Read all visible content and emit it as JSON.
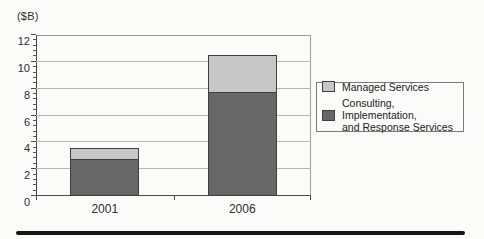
{
  "figure": {
    "legend": {
      "items": [
        {
          "label": "Managed Services",
          "color": "#c7c7c7"
        },
        {
          "label": "Consulting, Implementation,\nand Response Services",
          "color": "#676767"
        }
      ]
    }
  },
  "chart_data": {
    "type": "bar",
    "stacked": true,
    "categories": [
      "2001",
      "2006"
    ],
    "series": [
      {
        "name": "Consulting, Implementation, and Response Services",
        "color": "#676767",
        "values": [
          2.7,
          7.7
        ]
      },
      {
        "name": "Managed Services",
        "color": "#c7c7c7",
        "values": [
          0.9,
          2.8
        ]
      }
    ],
    "title": "",
    "xlabel": "",
    "ylabel": "($B)",
    "ylim": [
      0,
      12
    ],
    "yticks": [
      0,
      2,
      4,
      6,
      8,
      10,
      12
    ],
    "minor_tick_step": 0.4,
    "grid": true,
    "legend_position": "right",
    "gridline_color": "#b5b5b5",
    "axis_color": "#4a4a4a"
  }
}
